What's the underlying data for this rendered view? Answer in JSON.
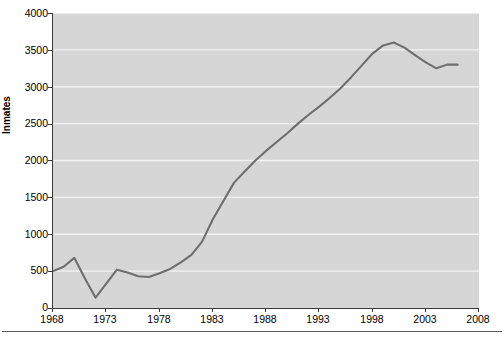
{
  "chart_data": {
    "type": "line",
    "title": "",
    "xlabel": "",
    "ylabel": "Inmates",
    "xlim": [
      1968,
      2008
    ],
    "ylim": [
      0,
      4000
    ],
    "grid": true,
    "legend_position": "none",
    "x_ticks": [
      1968,
      1973,
      1978,
      1983,
      1988,
      1993,
      1998,
      2003,
      2008
    ],
    "y_ticks": [
      0,
      500,
      1000,
      1500,
      2000,
      2500,
      3000,
      3500,
      4000
    ],
    "series": [
      {
        "name": "Inmates",
        "color": "#6e6e6e",
        "x": [
          1968,
          1969,
          1970,
          1971,
          1972,
          1973,
          1974,
          1975,
          1976,
          1977,
          1978,
          1979,
          1980,
          1981,
          1982,
          1983,
          1984,
          1985,
          1986,
          1987,
          1988,
          1989,
          1990,
          1991,
          1992,
          1993,
          1994,
          1995,
          1996,
          1997,
          1998,
          1999,
          2000,
          2001,
          2002,
          2003,
          2004,
          2005,
          2006
        ],
        "values": [
          500,
          560,
          680,
          400,
          140,
          330,
          520,
          480,
          430,
          420,
          470,
          530,
          620,
          720,
          900,
          1200,
          1450,
          1700,
          1850,
          2000,
          2130,
          2250,
          2370,
          2500,
          2620,
          2730,
          2850,
          2980,
          3130,
          3290,
          3450,
          3560,
          3600,
          3530,
          3430,
          3330,
          3250,
          3300,
          3300
        ]
      }
    ]
  },
  "axis": {
    "y_label": "Inmates",
    "y_tick_labels": [
      "4000",
      "3500",
      "3000",
      "2500",
      "2000",
      "1500",
      "1000",
      "500",
      "0"
    ],
    "x_tick_labels": [
      "1968",
      "1973",
      "1978",
      "1983",
      "1988",
      "1993",
      "1998",
      "2003",
      "2008"
    ]
  },
  "style": {
    "plot_background": "#d6d6d6",
    "gridline_color": "#f2f2f2",
    "line_color": "#6e6e6e",
    "axis_color": "#3a3a3a",
    "text_color": "#000000"
  }
}
